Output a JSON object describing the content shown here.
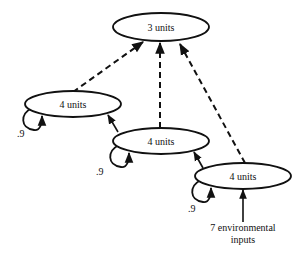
{
  "nodes": [
    {
      "id": "top",
      "label": "3 units"
    },
    {
      "id": "left",
      "label": "4 units"
    },
    {
      "id": "middle",
      "label": "4 units"
    },
    {
      "id": "right",
      "label": "4 units"
    }
  ],
  "self_loops": [
    {
      "node": "left",
      "weight": ".9"
    },
    {
      "node": "middle",
      "weight": ".9"
    },
    {
      "node": "right",
      "weight": ".9"
    }
  ],
  "edges": [
    {
      "from": "left",
      "to": "top",
      "style": "dashed"
    },
    {
      "from": "middle",
      "to": "top",
      "style": "dashed"
    },
    {
      "from": "right",
      "to": "top",
      "style": "dashed"
    },
    {
      "from": "middle",
      "to": "left",
      "style": "solid"
    },
    {
      "from": "right",
      "to": "middle",
      "style": "solid"
    },
    {
      "from": "input",
      "to": "right",
      "style": "solid"
    }
  ],
  "input": {
    "line1": "7 environmental",
    "line2": "inputs"
  }
}
